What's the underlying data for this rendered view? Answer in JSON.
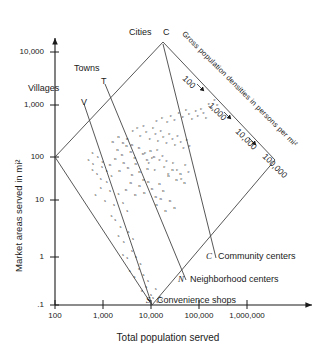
{
  "chart_data": {
    "type": "scatter",
    "title": "",
    "xlabel": "Total population served",
    "ylabel": "Market areas served in mi²",
    "xscale": "log",
    "yscale": "log",
    "xlim": [
      100,
      1000000
    ],
    "ylim": [
      0.1,
      10000
    ],
    "xticks": [
      "100",
      "1,000",
      "10,000",
      "100,000",
      "1,000,000"
    ],
    "xtick_values": [
      100,
      1000,
      10000,
      100000,
      1000000
    ],
    "yticks": [
      "10,000",
      "1,000",
      "100",
      "10",
      "1",
      ".1"
    ],
    "ytick_values": [
      10000,
      1000,
      100,
      10,
      1,
      0.1
    ],
    "grid": false,
    "density_axis_title": "Gross population densities in persons per mi²",
    "density_ticks": [
      "100",
      "1,000",
      "10,000",
      "100,000"
    ],
    "density_tick_values": [
      100,
      1000,
      10000,
      100000
    ],
    "categories": [
      {
        "key": "villages",
        "name": "Villages",
        "letter": "V"
      },
      {
        "key": "towns",
        "name": "Towns",
        "letter": "T"
      },
      {
        "key": "cities",
        "name": "Cities",
        "letter": "C"
      }
    ],
    "legend_position": "lower-right",
    "legend": [
      {
        "symbol": "C",
        "label": "Community centers"
      },
      {
        "symbol": "N",
        "label": "Neighborhood centers"
      },
      {
        "symbol": "S",
        "label": "Convenience shops"
      }
    ],
    "series": [
      {
        "name": "Community centers",
        "symbol": "c",
        "points": [
          [
            4200,
            260
          ],
          [
            5200,
            300
          ],
          [
            6000,
            210
          ],
          [
            7000,
            330
          ],
          [
            8000,
            250
          ],
          [
            9500,
            180
          ],
          [
            11000,
            300
          ],
          [
            12500,
            230
          ],
          [
            14000,
            170
          ],
          [
            16000,
            260
          ],
          [
            18000,
            200
          ],
          [
            21000,
            150
          ],
          [
            24000,
            230
          ],
          [
            28000,
            185
          ],
          [
            32000,
            140
          ],
          [
            36000,
            210
          ],
          [
            42000,
            160
          ],
          [
            48000,
            120
          ],
          [
            56000,
            175
          ],
          [
            64000,
            135
          ],
          [
            13000,
            420
          ],
          [
            17000,
            480
          ],
          [
            22000,
            390
          ],
          [
            26000,
            520
          ],
          [
            31000,
            440
          ],
          [
            38000,
            600
          ],
          [
            46000,
            500
          ],
          [
            54000,
            680
          ],
          [
            62000,
            560
          ],
          [
            72000,
            460
          ],
          [
            86000,
            640
          ],
          [
            95000,
            520
          ],
          [
            110000,
            720
          ],
          [
            125000,
            600
          ],
          [
            140000,
            480
          ],
          [
            9000,
            60
          ],
          [
            12000,
            45
          ],
          [
            15000,
            70
          ],
          [
            19000,
            52
          ],
          [
            23000,
            38
          ],
          [
            29000,
            62
          ],
          [
            35000,
            44
          ],
          [
            43000,
            30
          ],
          [
            52000,
            55
          ],
          [
            61000,
            40
          ],
          [
            160000,
            900
          ],
          [
            185000,
            760
          ],
          [
            210000,
            1100
          ],
          [
            240000,
            860
          ],
          [
            7500,
            95
          ],
          [
            10500,
            78
          ],
          [
            13500,
            110
          ],
          [
            17500,
            85
          ],
          [
            21000,
            66
          ]
        ]
      },
      {
        "name": "Neighborhood centers",
        "symbol": "n",
        "points": [
          [
            1400,
            55
          ],
          [
            1800,
            75
          ],
          [
            2200,
            42
          ],
          [
            2700,
            62
          ],
          [
            3300,
            48
          ],
          [
            4000,
            35
          ],
          [
            4800,
            58
          ],
          [
            5800,
            40
          ],
          [
            7000,
            28
          ],
          [
            8400,
            46
          ],
          [
            2000,
            110
          ],
          [
            2500,
            90
          ],
          [
            3100,
            130
          ],
          [
            3800,
            100
          ],
          [
            4600,
            78
          ],
          [
            5600,
            120
          ],
          [
            6800,
            92
          ],
          [
            8200,
            70
          ],
          [
            9800,
            105
          ],
          [
            11500,
            82
          ],
          [
            3000,
            18
          ],
          [
            3800,
            25
          ],
          [
            4700,
            14
          ],
          [
            5800,
            22
          ],
          [
            7200,
            16
          ],
          [
            8800,
            26
          ],
          [
            10500,
            19
          ],
          [
            12500,
            13
          ],
          [
            15000,
            24
          ],
          [
            18000,
            17
          ],
          [
            1600,
            160
          ],
          [
            2100,
            200
          ],
          [
            2600,
            150
          ],
          [
            3200,
            185
          ],
          [
            4000,
            140
          ],
          [
            13000,
            9
          ],
          [
            16000,
            12
          ],
          [
            20000,
            7
          ],
          [
            25000,
            11
          ],
          [
            31000,
            8
          ],
          [
            23000,
            34
          ],
          [
            28000,
            44
          ],
          [
            34000,
            28
          ],
          [
            41000,
            38
          ],
          [
            50000,
            25
          ]
        ]
      },
      {
        "name": "Convenience shops",
        "symbol": "s",
        "points": [
          [
            700,
            14
          ],
          [
            900,
            20
          ],
          [
            1100,
            11
          ],
          [
            1400,
            17
          ],
          [
            1700,
            9
          ],
          [
            2100,
            15
          ],
          [
            2600,
            10
          ],
          [
            3200,
            7
          ],
          [
            900,
            30
          ],
          [
            1200,
            26
          ],
          [
            600,
            45
          ],
          [
            750,
            38
          ],
          [
            950,
            52
          ],
          [
            1200,
            42
          ],
          [
            1500,
            34
          ],
          [
            2600,
            0.95
          ],
          [
            3200,
            0.8
          ],
          [
            4000,
            1.1
          ],
          [
            4900,
            0.85
          ],
          [
            6000,
            0.62
          ],
          [
            3600,
            0.45
          ],
          [
            4500,
            0.35
          ],
          [
            5600,
            0.5
          ],
          [
            7000,
            0.38
          ],
          [
            8600,
            0.28
          ],
          [
            6400,
            0.18
          ],
          [
            8000,
            0.22
          ],
          [
            10000,
            0.15
          ],
          [
            12500,
            0.2
          ],
          [
            15500,
            0.14
          ],
          [
            9000,
            0.12
          ],
          [
            11000,
            0.13
          ],
          [
            13500,
            0.11
          ],
          [
            16500,
            0.12
          ],
          [
            2100,
            2.2
          ],
          [
            2700,
            1.7
          ],
          [
            3400,
            2.6
          ],
          [
            4200,
            1.9
          ],
          [
            500,
            70
          ],
          [
            620,
            58
          ],
          [
            780,
            80
          ],
          [
            980,
            64
          ],
          [
            600,
            95
          ],
          [
            1800,
            4.5
          ],
          [
            2300,
            3.4
          ],
          [
            1500,
            5.5
          ]
        ]
      }
    ]
  }
}
